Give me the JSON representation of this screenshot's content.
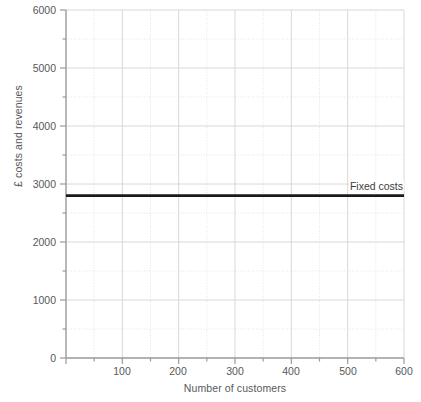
{
  "chart_data": {
    "type": "line",
    "title": "",
    "xlabel": "Number of customers",
    "ylabel": "£ costs and revenues",
    "xlim": [
      0,
      600
    ],
    "ylim": [
      0,
      6000
    ],
    "x_ticks": [
      0,
      100,
      200,
      300,
      400,
      500,
      600
    ],
    "x_tick_labels": [
      "0",
      "100",
      "200",
      "300",
      "400",
      "500",
      "600"
    ],
    "x_minor_step": 50,
    "y_ticks": [
      0,
      1000,
      2000,
      3000,
      4000,
      5000,
      6000
    ],
    "y_tick_labels": [
      "0",
      "1000",
      "2000",
      "3000",
      "4000",
      "5000",
      "6000"
    ],
    "y_minor_step": 500,
    "grid": true,
    "grid_major_color": "#d8d8d8",
    "grid_minor_color": "#e4e4e4",
    "axis_color": "#9a9a9a",
    "legend_position": "inline-right",
    "series": [
      {
        "name": "Fixed costs",
        "label": "Fixed costs",
        "color": "#1a1a1a",
        "line_width": 2.6,
        "x": [
          0,
          600
        ],
        "values": [
          2800,
          2800
        ]
      }
    ],
    "annotations": [
      {
        "text": "Fixed costs",
        "x": 600,
        "y": 2800,
        "anchor": "end-above"
      }
    ]
  },
  "axes": {
    "y_title": "£ costs and revenues",
    "x_title": "Number of customers",
    "y_labels": [
      "6000",
      "5000",
      "4000",
      "3000",
      "2000",
      "1000",
      "0"
    ],
    "x_labels": [
      "0",
      "100",
      "200",
      "300",
      "400",
      "500",
      "600"
    ]
  },
  "series_labels": {
    "fixed_costs": "Fixed costs"
  }
}
